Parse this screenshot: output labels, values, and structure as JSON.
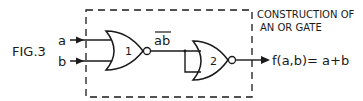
{
  "figure": {
    "label": "FIG.3",
    "caption_line1": "CONSTRUCTION OF",
    "caption_line2": "AN OR GATE"
  },
  "inputs": [
    {
      "name": "a"
    },
    {
      "name": "b"
    }
  ],
  "gates": [
    {
      "id": "1",
      "type": "NOR"
    },
    {
      "id": "2",
      "type": "NOR"
    }
  ],
  "intermediate": {
    "label": "ab",
    "overline": true
  },
  "output": {
    "expression": "f(a,b)= a+b"
  },
  "colors": {
    "ink": "#1a1a1a",
    "background": "#ffffff"
  }
}
